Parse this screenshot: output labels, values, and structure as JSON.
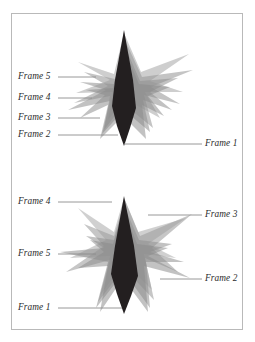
{
  "figure": {
    "title": "",
    "panel": {
      "border_color": "#b9b9b9",
      "background": "#ffffff"
    },
    "palette": {
      "central_dark": "#231f20",
      "spike_gray_light": "#c9c9c9",
      "spike_gray_mid": "#a8a8a8",
      "spike_gray_dark": "#8a8a8a",
      "leader_line": "#8c8c8c",
      "label_text": "#2b2b2b"
    },
    "diagrams": [
      {
        "name": "upper-diagram",
        "labels": [
          {
            "text": "Frame 5",
            "side": "left",
            "x": 18,
            "y": 72
          },
          {
            "text": "Frame 4",
            "side": "left",
            "x": 18,
            "y": 93
          },
          {
            "text": "Frame 3",
            "side": "left",
            "x": 18,
            "y": 113
          },
          {
            "text": "Frame 2",
            "side": "left",
            "x": 18,
            "y": 130
          },
          {
            "text": "Frame 1",
            "side": "right",
            "x": 205,
            "y": 139
          }
        ]
      },
      {
        "name": "lower-diagram",
        "labels": [
          {
            "text": "Frame 4",
            "side": "left",
            "x": 18,
            "y": 197
          },
          {
            "text": "Frame 5",
            "side": "left",
            "x": 18,
            "y": 249
          },
          {
            "text": "Frame 1",
            "side": "left",
            "x": 18,
            "y": 303
          },
          {
            "text": "Frame 3",
            "side": "right",
            "x": 205,
            "y": 210
          },
          {
            "text": "Frame 2",
            "side": "right",
            "x": 205,
            "y": 274
          }
        ]
      }
    ]
  }
}
